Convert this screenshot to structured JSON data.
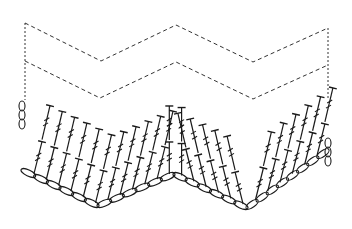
{
  "diagram": {
    "type": "crochet-chart",
    "colors": {
      "background": "#ffffff",
      "ink": "#1a1a1a",
      "dashed": "#333333"
    },
    "stitch_legend": {
      "chain": "chain stitch (oval)",
      "treble": "treble crochet (T with two bars)",
      "turning_chain": "turning chain (stacked ovals)",
      "repeat_rows": "dashed lines indicate rows to be repeated"
    },
    "foundation_chain": {
      "points": [
        [
          22,
          170
        ],
        [
          98,
          206
        ],
        [
          174,
          174
        ],
        [
          247,
          208
        ],
        [
          328,
          150
        ]
      ]
    },
    "dashed_rows": [
      {
        "name": "row-repeat-upper",
        "points": [
          [
            25,
            23
          ],
          [
            101,
            61
          ],
          [
            176,
            25
          ],
          [
            253,
            62
          ],
          [
            328,
            28
          ]
        ]
      },
      {
        "name": "row-repeat-lower",
        "points": [
          [
            25,
            61
          ],
          [
            100,
            98
          ],
          [
            176,
            62
          ],
          [
            253,
            99
          ],
          [
            328,
            65
          ]
        ]
      }
    ],
    "dashed_sides": [
      {
        "name": "left-edge",
        "x": 25,
        "y1": 23,
        "y2": 100
      },
      {
        "name": "right-edge",
        "x": 328,
        "y1": 28,
        "y2": 100
      }
    ],
    "peaks_at_x": [
      174
    ],
    "valleys_at_x": [
      98,
      247
    ]
  }
}
